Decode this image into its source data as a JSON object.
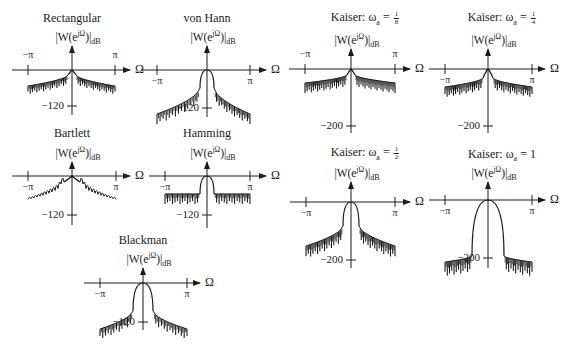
{
  "figure": {
    "y_label_base": "|W(e",
    "y_label_exp": "jΩ",
    "y_label_close": ")|",
    "y_label_sub": "dB",
    "x_axis_label": "Ω",
    "tick_neg_pi": "−π",
    "tick_pi": "π"
  },
  "panels": [
    {
      "id": "rectangular",
      "title": "Rectangular",
      "min_db_label": "−120"
    },
    {
      "id": "von-hann",
      "title": "von Hann",
      "min_db_label": "−120"
    },
    {
      "id": "bartlett",
      "title": "Bartlett",
      "min_db_label": "−120"
    },
    {
      "id": "hamming",
      "title": "Hamming",
      "min_db_label": "−120"
    },
    {
      "id": "blackman",
      "title": "Blackman",
      "min_db_label": "−120"
    },
    {
      "id": "kaiser-1-8",
      "title_prefix": "Kaiser: ω",
      "title_sub": "a",
      "title_eq": " = ",
      "frac_num": "1",
      "frac_den": "8",
      "min_db_label": "−200"
    },
    {
      "id": "kaiser-1-4",
      "title_prefix": "Kaiser: ω",
      "title_sub": "a",
      "title_eq": " = ",
      "frac_num": "1",
      "frac_den": "4",
      "min_db_label": "−200"
    },
    {
      "id": "kaiser-1-2",
      "title_prefix": "Kaiser: ω",
      "title_sub": "a",
      "title_eq": " = ",
      "frac_num": "1",
      "frac_den": "2",
      "min_db_label": "−200"
    },
    {
      "id": "kaiser-1",
      "title_prefix": "Kaiser: ω",
      "title_sub": "a",
      "title_eq": " = 1",
      "min_db_label": "−200"
    }
  ],
  "chart_data": [
    {
      "type": "line",
      "title": "Rectangular",
      "xlabel": "Ω",
      "ylabel": "|W(e^{jΩ})|_dB",
      "x_ticks": [
        "−π",
        "π"
      ],
      "y_ticks": [
        "−120"
      ],
      "mainlobe": "narrow",
      "sidelobe_level": "high, slow decay"
    },
    {
      "type": "line",
      "title": "von Hann",
      "xlabel": "Ω",
      "ylabel": "|W(e^{jΩ})|_dB",
      "x_ticks": [
        "−π",
        "π"
      ],
      "y_ticks": [
        "−120"
      ],
      "mainlobe": "wider",
      "sidelobe_level": "low, fast decay"
    },
    {
      "type": "line",
      "title": "Bartlett",
      "xlabel": "Ω",
      "ylabel": "|W(e^{jΩ})|_dB",
      "x_ticks": [
        "−π",
        "π"
      ],
      "y_ticks": [
        "−120"
      ],
      "mainlobe": "wider",
      "sidelobe_level": "moderate, smooth lobes"
    },
    {
      "type": "line",
      "title": "Hamming",
      "xlabel": "Ω",
      "ylabel": "|W(e^{jΩ})|_dB",
      "x_ticks": [
        "−π",
        "π"
      ],
      "y_ticks": [
        "−120"
      ],
      "mainlobe": "wider",
      "sidelobe_level": "low, nearly flat"
    },
    {
      "type": "line",
      "title": "Blackman",
      "xlabel": "Ω",
      "ylabel": "|W(e^{jΩ})|_dB",
      "x_ticks": [
        "−π",
        "π"
      ],
      "y_ticks": [
        "−120"
      ],
      "mainlobe": "widest of fixed windows",
      "sidelobe_level": "very low"
    },
    {
      "type": "line",
      "title": "Kaiser: ωa = 1/8",
      "xlabel": "Ω",
      "ylabel": "|W(e^{jΩ})|_dB",
      "x_ticks": [
        "−π",
        "π"
      ],
      "y_ticks": [
        "−200"
      ],
      "mainlobe": "narrow",
      "sidelobe_level": "high"
    },
    {
      "type": "line",
      "title": "Kaiser: ωa = 1/4",
      "xlabel": "Ω",
      "ylabel": "|W(e^{jΩ})|_dB",
      "x_ticks": [
        "−π",
        "π"
      ],
      "y_ticks": [
        "−200"
      ],
      "mainlobe": "narrow",
      "sidelobe_level": "high"
    },
    {
      "type": "line",
      "title": "Kaiser: ωa = 1/2",
      "xlabel": "Ω",
      "ylabel": "|W(e^{jΩ})|_dB",
      "x_ticks": [
        "−π",
        "π"
      ],
      "y_ticks": [
        "−200"
      ],
      "mainlobe": "medium",
      "sidelobe_level": "lower"
    },
    {
      "type": "line",
      "title": "Kaiser: ωa = 1",
      "xlabel": "Ω",
      "ylabel": "|W(e^{jΩ})|_dB",
      "x_ticks": [
        "−π",
        "π"
      ],
      "y_ticks": [
        "−200"
      ],
      "mainlobe": "wide",
      "sidelobe_level": "very low"
    }
  ]
}
